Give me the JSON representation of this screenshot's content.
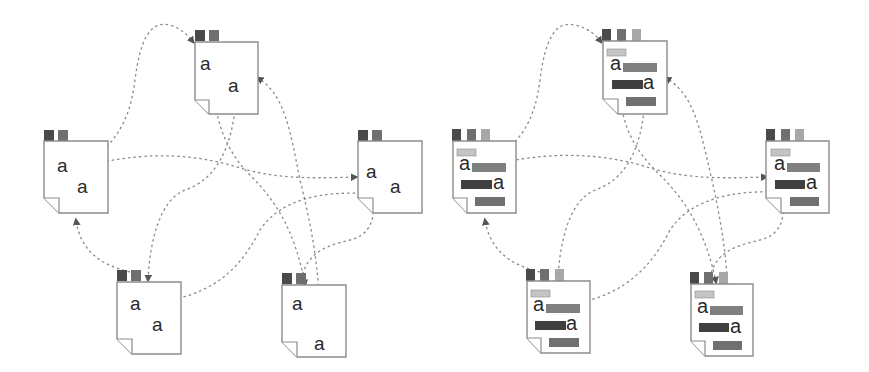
{
  "diagram": {
    "colors": {
      "edge": "#8a8a8a",
      "page_border": "#8c8c8c",
      "tab_dark": "#4a4a4a",
      "tab_mid": "#6f6f6f",
      "tab_light": "#a8a8a8",
      "bar_light": "#c4c4c4",
      "bar_mid": "#808080",
      "bar_dark": "#3f3f3f",
      "glyph": "#2a2a2a"
    },
    "left_graph": {
      "label": "plain documents",
      "nodes": [
        {
          "id": "L-top",
          "glyphs": [
            "a",
            "a"
          ],
          "tabs": 2
        },
        {
          "id": "L-left",
          "glyphs": [
            "a",
            "a"
          ],
          "tabs": 2
        },
        {
          "id": "L-right",
          "glyphs": [
            "a",
            "a"
          ],
          "tabs": 2
        },
        {
          "id": "L-bottom-left",
          "glyphs": [
            "a",
            "a"
          ],
          "tabs": 2
        },
        {
          "id": "L-bottom-right",
          "glyphs": [
            "a",
            "a"
          ],
          "tabs": 2
        }
      ]
    },
    "right_graph": {
      "label": "annotated documents",
      "nodes": [
        {
          "id": "R-top",
          "glyphs": [
            "a",
            "a"
          ],
          "tabs": 3,
          "bars": 4
        },
        {
          "id": "R-left",
          "glyphs": [
            "a",
            "a"
          ],
          "tabs": 3,
          "bars": 4
        },
        {
          "id": "R-right",
          "glyphs": [
            "a",
            "a"
          ],
          "tabs": 3,
          "bars": 4
        },
        {
          "id": "R-bottom-left",
          "glyphs": [
            "a",
            "a"
          ],
          "tabs": 3,
          "bars": 4
        },
        {
          "id": "R-bottom-right",
          "glyphs": [
            "a",
            "a"
          ],
          "tabs": 3,
          "bars": 4
        }
      ]
    }
  }
}
